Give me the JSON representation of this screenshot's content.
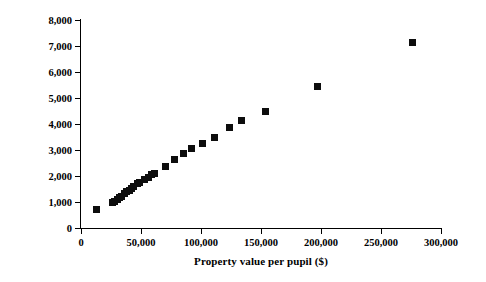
{
  "chart_data": {
    "type": "scatter",
    "title": "",
    "xlabel": "Property value per pupil ($)",
    "ylabel": "Revenue per pupil ($)",
    "xlim": [
      0,
      300000
    ],
    "ylim": [
      0,
      8000
    ],
    "grid": false,
    "legend": null,
    "marker": {
      "shape": "square",
      "color": "#0d0d0d",
      "size_px": 7
    },
    "xticks": [
      0,
      50000,
      100000,
      150000,
      200000,
      250000,
      300000
    ],
    "xtick_labels": [
      "0",
      "50,000",
      "100,000",
      "150,000",
      "200,000",
      "250,000",
      "300,000"
    ],
    "yticks": [
      0,
      1000,
      2000,
      3000,
      4000,
      5000,
      6000,
      7000,
      8000
    ],
    "ytick_labels": [
      "0",
      "1,000",
      "2,000",
      "3,000",
      "4,000",
      "5,000",
      "6,000",
      "7,000",
      "8,000"
    ],
    "series": [
      {
        "name": "districts",
        "points": [
          {
            "x": 13000,
            "y": 700
          },
          {
            "x": 26000,
            "y": 1000
          },
          {
            "x": 28000,
            "y": 1020
          },
          {
            "x": 30000,
            "y": 1100
          },
          {
            "x": 32000,
            "y": 1180
          },
          {
            "x": 34000,
            "y": 1220
          },
          {
            "x": 36000,
            "y": 1320
          },
          {
            "x": 38000,
            "y": 1400
          },
          {
            "x": 40000,
            "y": 1450
          },
          {
            "x": 42000,
            "y": 1520
          },
          {
            "x": 44000,
            "y": 1600
          },
          {
            "x": 47000,
            "y": 1700
          },
          {
            "x": 49000,
            "y": 1740
          },
          {
            "x": 53000,
            "y": 1850
          },
          {
            "x": 56000,
            "y": 1960
          },
          {
            "x": 59000,
            "y": 2040
          },
          {
            "x": 61000,
            "y": 2080
          },
          {
            "x": 70000,
            "y": 2380
          },
          {
            "x": 78000,
            "y": 2640
          },
          {
            "x": 85000,
            "y": 2870
          },
          {
            "x": 92000,
            "y": 3050
          },
          {
            "x": 101000,
            "y": 3240
          },
          {
            "x": 111000,
            "y": 3480
          },
          {
            "x": 124000,
            "y": 3860
          },
          {
            "x": 134000,
            "y": 4120
          },
          {
            "x": 154000,
            "y": 4490
          },
          {
            "x": 197000,
            "y": 5460
          },
          {
            "x": 276000,
            "y": 7140
          }
        ]
      }
    ]
  }
}
